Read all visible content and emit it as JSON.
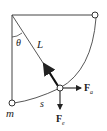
{
  "diagram": {
    "type": "pendulum-force-diagram",
    "labels": {
      "angle": "θ",
      "length": "L",
      "arc": "s",
      "mass": "m",
      "force_a": "F",
      "force_a_sub": "a",
      "force_e": "F",
      "force_e_sub": "e"
    },
    "colors": {
      "stroke": "#333333",
      "background": "#ffffff"
    }
  }
}
